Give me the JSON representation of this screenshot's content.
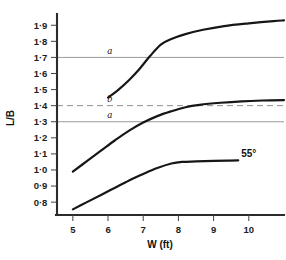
{
  "chart_data": {
    "type": "line",
    "title": "",
    "xlabel": "W (ft)",
    "ylabel": "L/B",
    "xlim": [
      4.55,
      11.0
    ],
    "ylim": [
      0.72,
      1.97
    ],
    "grid": false,
    "legend_position": "right-inline-labels",
    "x_ticks": [
      "5",
      "6",
      "7",
      "8",
      "9",
      "10"
    ],
    "x_tick_values": [
      5,
      6,
      7,
      8,
      9,
      10
    ],
    "y_ticks": [
      "0·8",
      "0·9",
      "1·0",
      "1·1",
      "1·2",
      "1·3",
      "1·4",
      "1·5",
      "1·6",
      "1·7",
      "1·8",
      "1·9"
    ],
    "y_tick_values": [
      0.8,
      0.9,
      1.0,
      1.1,
      1.2,
      1.3,
      1.4,
      1.5,
      1.6,
      1.7,
      1.8,
      1.9
    ],
    "series": [
      {
        "name": "35°",
        "label": "35°",
        "x": [
          6.0,
          6.3,
          6.6,
          6.9,
          7.2,
          7.5,
          7.8,
          8.2,
          8.7,
          9.3,
          10.0,
          10.7,
          11.0
        ],
        "values": [
          1.45,
          1.5,
          1.56,
          1.63,
          1.71,
          1.78,
          1.815,
          1.845,
          1.872,
          1.895,
          1.912,
          1.926,
          1.93
        ]
      },
      {
        "name": "45°",
        "label": "45°",
        "x": [
          5.0,
          5.4,
          5.8,
          6.2,
          6.6,
          7.0,
          7.4,
          7.8,
          8.2,
          8.6,
          9.2,
          9.8,
          10.4,
          11.0
        ],
        "values": [
          0.99,
          1.055,
          1.12,
          1.185,
          1.245,
          1.295,
          1.335,
          1.365,
          1.39,
          1.405,
          1.418,
          1.427,
          1.432,
          1.435
        ]
      },
      {
        "name": "55°",
        "label": "55°",
        "x": [
          5.0,
          5.4,
          5.8,
          6.2,
          6.6,
          7.0,
          7.4,
          7.8,
          8.1,
          8.5,
          9.0,
          9.4,
          9.7
        ],
        "values": [
          0.755,
          0.8,
          0.845,
          0.89,
          0.935,
          0.975,
          1.012,
          1.04,
          1.05,
          1.053,
          1.056,
          1.058,
          1.06
        ]
      }
    ],
    "reference_lines": [
      {
        "label": "a",
        "value": 1.7,
        "style": "solid",
        "label_x": 6.05
      },
      {
        "label": "b",
        "value": 1.4,
        "style": "dashed",
        "label_x": 6.05
      },
      {
        "label": "a",
        "value": 1.3,
        "style": "solid",
        "label_x": 6.05
      }
    ]
  }
}
